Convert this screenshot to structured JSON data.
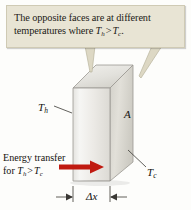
{
  "figure": {
    "background_color": "#fdfdfb"
  },
  "callout": {
    "background_color": "#e8e4d4",
    "border_color": "#cfcab4",
    "line1": "The opposite faces are at different",
    "line2_prefix": "temperatures where ",
    "var_hot": "T",
    "sub_hot": "h",
    "operator": ">",
    "var_cold": "T",
    "sub_cold": "c",
    "line2_suffix": ".",
    "pointer_count": 2
  },
  "slab": {
    "front_face_color": "#f2f1ee",
    "side_face_color": "#dddbd4",
    "top_face_color": "#e9e8e3",
    "edge_color": "#8e8c86"
  },
  "labels": {
    "hot_face": {
      "var": "T",
      "sub": "h"
    },
    "area": {
      "text": "A"
    },
    "cold_face": {
      "var": "T",
      "sub": "c"
    },
    "thickness": {
      "text": "Δx"
    }
  },
  "energy_transfer": {
    "line1": "Energy transfer",
    "line2_prefix": "for ",
    "var_hot": "T",
    "sub_hot": "h",
    "operator": ">",
    "var_cold": "T",
    "sub_cold": "c",
    "arrow_color": "#c01a10",
    "arrow_direction": "right"
  },
  "dimension": {
    "label": "Δx",
    "line_color": "#3a3834"
  }
}
